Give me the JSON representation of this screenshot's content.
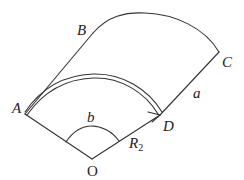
{
  "diagram": {
    "type": "geometry-figure",
    "stroke_color": "#333333",
    "background": "#ffffff",
    "labels": {
      "A": "A",
      "B": "B",
      "C": "C",
      "D": "D",
      "O": "O",
      "a": "a",
      "b": "b",
      "R": "R",
      "R_sub": "2"
    },
    "points": {
      "A": [
        25,
        114
      ],
      "D": [
        160,
        115
      ],
      "O": [
        92,
        159
      ],
      "C": [
        219,
        52
      ],
      "B_corner": [
        93,
        33
      ]
    },
    "elements": [
      {
        "kind": "segment",
        "from": "A",
        "to": "O"
      },
      {
        "kind": "segment",
        "from": "O",
        "to": "D"
      },
      {
        "kind": "segment",
        "from": "D",
        "to": "C",
        "label": "a"
      },
      {
        "kind": "segment",
        "from": "A",
        "to": "B_corner"
      },
      {
        "kind": "arc",
        "from": "B_corner",
        "to": "C",
        "note": "outer curved edge B–C"
      },
      {
        "kind": "double-arc",
        "from": "A",
        "to": "D",
        "arrow_at": "D"
      },
      {
        "kind": "angle-arc",
        "center": "O",
        "label": "b"
      },
      {
        "kind": "radius-label",
        "segment": "O-D",
        "label": "R2"
      }
    ]
  }
}
